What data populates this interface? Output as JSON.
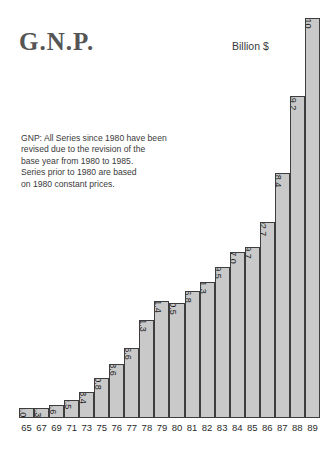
{
  "title": "G.N.P.",
  "unit_label": "Billion $",
  "note": {
    "lines": [
      "GNP: All Series since 1980 have been",
      "revised due to the revision of the",
      "base year from 1980 to 1985.",
      "Series prior to 1980 are based",
      "on 1980 constant prices."
    ]
  },
  "colors": {
    "bar_fill": "#c9c9c9",
    "bar_border": "#3d3d3d",
    "title": "#555555",
    "text": "#2b2b2b",
    "background": "#ffffff"
  },
  "chart_data": {
    "type": "bar",
    "title": "G.N.P.",
    "xlabel": "",
    "ylabel": "Billion $",
    "ylim": [
      0,
      210
    ],
    "grid": false,
    "legend": "none",
    "orientation": "vertical",
    "value_label_rotation": 90,
    "categories": [
      "65",
      "67",
      "69",
      "71",
      "73",
      "75",
      "76",
      "77",
      "78",
      "79",
      "80",
      "81",
      "82",
      "83",
      "84",
      "85",
      "86",
      "87",
      "88",
      "89"
    ],
    "values": [
      3.0,
      4.3,
      6.6,
      9.5,
      13.4,
      20.8,
      28.6,
      36.6,
      51.3,
      61.4,
      60.5,
      66.8,
      71.3,
      79.5,
      87.0,
      89.7,
      102.7,
      128.4,
      169.2,
      210
    ],
    "value_labels": [
      "3.0",
      "4.3",
      "6.6",
      "9.5",
      "13.4",
      "20.8",
      "28.6",
      "36.6",
      "51.3",
      "61.4",
      "60.5",
      "66.8",
      "71.3",
      "79.5",
      "87.0",
      "89.7",
      "102.7",
      "128.4",
      "169.2",
      "210"
    ],
    "annotations": [
      "GNP: All Series since 1980 have been",
      "revised due to the revision of the",
      "base year from 1980 to 1985.",
      "Series prior to 1980 are based",
      "on 1980 constant prices."
    ]
  }
}
